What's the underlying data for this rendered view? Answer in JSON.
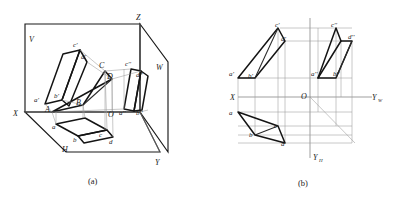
{
  "figure": {
    "caption_a": "(a)",
    "caption_b": "(b)"
  },
  "diagram_a": {
    "name": "pictorial-three-projection-planes",
    "plane_labels": {
      "v_plane": "V",
      "h_plane": "H",
      "w_plane": "W"
    },
    "axis_labels": {
      "x": "X",
      "y": "Y",
      "z": "Z",
      "origin": "O"
    },
    "space_points": {
      "A": "A",
      "B": "B",
      "C": "C",
      "D": "D"
    },
    "front_view_points": {
      "a": "a'",
      "b": "b'",
      "c": "c'",
      "d": "d'"
    },
    "top_view_points": {
      "a": "a",
      "b": "b",
      "c": "c",
      "d": "d"
    },
    "side_view_points": {
      "a": "a''",
      "b": "b''",
      "c": "c''",
      "d": "d''"
    }
  },
  "diagram_b": {
    "name": "unfolded-orthographic-projection",
    "axis_labels": {
      "x": "X",
      "y_w": "Y",
      "y_w_sub": "W",
      "y_h": "Y",
      "y_h_sub": "H",
      "origin": "O"
    },
    "front_view_points": {
      "a": "a'",
      "b": "b'",
      "c": "c'",
      "d": "d'"
    },
    "top_view_points": {
      "a": "a",
      "b": "b",
      "c": "c",
      "d": "d"
    },
    "side_view_points": {
      "a": "a''",
      "b": "b''",
      "c": "c''",
      "d": "d''"
    }
  },
  "colors": {
    "ink": "#1a1a1a",
    "thin_line": "#8d8d8d",
    "background": "#ffffff"
  }
}
